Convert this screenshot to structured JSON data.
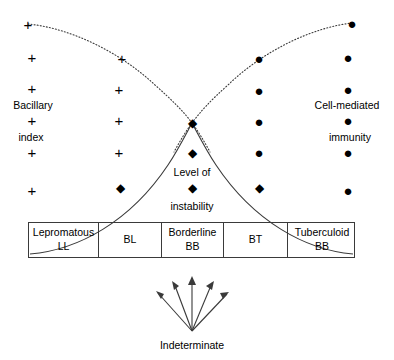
{
  "diagram": {
    "left_axis_label": {
      "line1": "Bacillary",
      "line2": "index"
    },
    "right_axis_label": {
      "line1": "Cell-mediated",
      "line2": "immunity"
    },
    "instability_label": {
      "line1": "Level of",
      "line2": "instability"
    },
    "bottom_label": "Indeterminate",
    "colors": {
      "stroke": "#3a3a3a",
      "text": "#000000",
      "background": "#ffffff"
    }
  },
  "table": {
    "columns": [
      {
        "top": "Lepromatous",
        "bottom": "LL"
      },
      {
        "top": "",
        "bottom": "BL"
      },
      {
        "top": "Borderline",
        "bottom": "BB"
      },
      {
        "top": "",
        "bottom": "BT"
      },
      {
        "top": "Tuberculoid",
        "bottom": "BB"
      }
    ]
  },
  "markers": {
    "plus_glyph": "+",
    "dot_glyph": "●",
    "diamond_glyph": "◆",
    "bacillary_column_1": [
      {
        "x": 28,
        "y": 24
      },
      {
        "x": 32,
        "y": 57
      },
      {
        "x": 32,
        "y": 88
      },
      {
        "x": 32,
        "y": 120
      },
      {
        "x": 32,
        "y": 152
      },
      {
        "x": 32,
        "y": 190
      }
    ],
    "bacillary_column_2": [
      {
        "x": 122,
        "y": 58
      },
      {
        "x": 119,
        "y": 89
      },
      {
        "x": 119,
        "y": 120
      },
      {
        "x": 119,
        "y": 152
      }
    ],
    "immunity_column_4": [
      {
        "x": 259,
        "y": 58
      },
      {
        "x": 259,
        "y": 90
      },
      {
        "x": 259,
        "y": 121
      },
      {
        "x": 259,
        "y": 152
      }
    ],
    "immunity_column_5": [
      {
        "x": 352,
        "y": 23
      },
      {
        "x": 348,
        "y": 57
      },
      {
        "x": 348,
        "y": 89
      },
      {
        "x": 348,
        "y": 120
      },
      {
        "x": 348,
        "y": 152
      },
      {
        "x": 348,
        "y": 190
      }
    ],
    "instability_diamonds": [
      {
        "x": 192,
        "y": 123
      },
      {
        "x": 192,
        "y": 153
      },
      {
        "x": 192,
        "y": 188
      },
      {
        "x": 120,
        "y": 188
      },
      {
        "x": 259,
        "y": 188
      }
    ]
  },
  "geometry": {
    "crossing_point": {
      "x": 192,
      "y": 123
    },
    "arrow_origin": {
      "x": 192,
      "y": 331
    },
    "arrow_tips": [
      {
        "x": 156,
        "y": 291
      },
      {
        "x": 172,
        "y": 281
      },
      {
        "x": 192,
        "y": 276
      },
      {
        "x": 214,
        "y": 281
      },
      {
        "x": 229,
        "y": 292
      }
    ],
    "bacillary_curve": "M28,24 C80,30 150,60 192,123 C200,135 205,147 210,160",
    "immunity_curve": "M352,23 C300,30 232,60 192,123 C184,135 179,147 174,160",
    "instability_curve": "M30,255 C95,250 160,215 192,123 C224,215 289,250 353,255"
  }
}
